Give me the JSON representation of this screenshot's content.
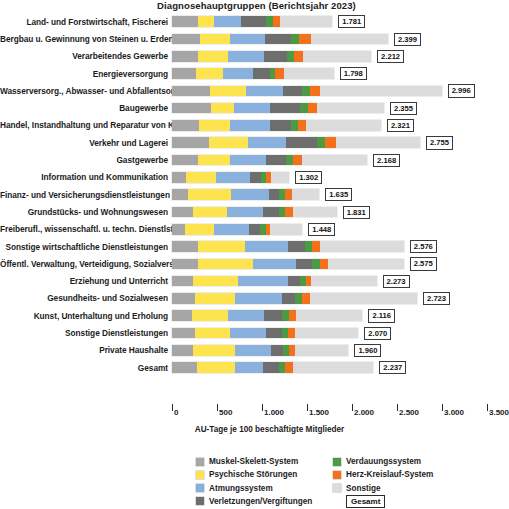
{
  "chart_data": {
    "type": "bar",
    "subtype": "horizontal-stacked",
    "title": "Diagnosehauptgruppen (Berichtsjahr 2023)",
    "xlabel": "AU-Tage je 100 beschäftigte Mitglieder",
    "ylabel": "",
    "xlim": [
      0,
      3500
    ],
    "xticks": [
      0,
      500,
      1000,
      1500,
      2000,
      2500,
      3000,
      3500
    ],
    "xtick_labels": [
      "0",
      "500",
      "1.000",
      "1.500",
      "2.000",
      "2.500",
      "3.000",
      "3.500"
    ],
    "grid": false,
    "legend_position": "bottom",
    "series": [
      {
        "name": "Muskel-Skelett-System",
        "color": "#a6a6a6",
        "values": [
          290,
          310,
          290,
          270,
          420,
          430,
          300,
          410,
          290,
          160,
          180,
          230,
          140,
          290,
          290,
          230,
          260,
          230,
          250,
          230,
          280
        ]
      },
      {
        "name": "Psychische Störungen",
        "color": "#fde44f",
        "values": [
          180,
          340,
          330,
          300,
          400,
          260,
          340,
          430,
          350,
          330,
          480,
          380,
          330,
          520,
          610,
          500,
          440,
          420,
          390,
          470,
          420
        ]
      },
      {
        "name": "Atmungssystem",
        "color": "#8ab0de",
        "values": [
          300,
          380,
          400,
          330,
          410,
          400,
          450,
          430,
          400,
          380,
          420,
          400,
          390,
          480,
          480,
          560,
          520,
          420,
          410,
          400,
          310
        ]
      },
      {
        "name": "Verletzungen/Vergiftungen",
        "color": "#6e6e6e",
        "values": [
          280,
          290,
          260,
          190,
          220,
          330,
          230,
          340,
          230,
          120,
          110,
          180,
          120,
          190,
          180,
          130,
          150,
          210,
          170,
          130,
          180
        ]
      },
      {
        "name": "Verdauungssystem",
        "color": "#4c9a43",
        "values": [
          70,
          90,
          80,
          60,
          80,
          90,
          80,
          90,
          80,
          60,
          70,
          70,
          60,
          80,
          80,
          70,
          80,
          80,
          70,
          70,
          70
        ]
      },
      {
        "name": "Herz-Kreislauf-System",
        "color": "#f4701b",
        "values": [
          80,
          130,
          100,
          90,
          110,
          100,
          90,
          120,
          90,
          50,
          70,
          80,
          50,
          90,
          90,
          60,
          80,
          90,
          80,
          70,
          80
        ]
      },
      {
        "name": "Sonstige",
        "color": "#dcdcdc",
        "values": [
          581,
          859,
          752,
          558,
          1356,
          742,
          831,
          935,
          728,
          202,
          305,
          491,
          358,
          926,
          845,
          723,
          1193,
          767,
          700,
          590,
          897
        ]
      }
    ],
    "categories": [
      "Land- und Forstwirtschaft, Fischerei",
      "Bergbau u. Gewinnung von Steinen u. Erden",
      "Verarbeitendes Gewerbe",
      "Energieversorgung",
      "Wasserversorg., Abwasser- und Abfallentsorg.",
      "Baugewerbe",
      "Handel, Instandhaltung und Reparatur von Kfz",
      "Verkehr und Lagerei",
      "Gastgewerbe",
      "Information und Kommunikation",
      "Finanz- und Versicherungsdienstleistungen",
      "Grundstücks- und Wohnungswesen",
      "Freiberufl., wissenschaftl. u. techn. Dienstlstg.",
      "Sonstige wirtschaftliche Dienstleistungen",
      "Öffentl. Verwaltung, Verteidigung, Sozialvers.",
      "Erziehung und Unterricht",
      "Gesundheits- und Sozialwesen",
      "Kunst, Unterhaltung und Erholung",
      "Sonstige Dienstleistungen",
      "Private Haushalte",
      "Gesamt"
    ],
    "totals": [
      1781,
      2399,
      2212,
      1798,
      2996,
      2355,
      2321,
      2755,
      2168,
      1302,
      1635,
      1831,
      1448,
      2576,
      2575,
      2273,
      2723,
      2116,
      2070,
      1960,
      2237
    ],
    "total_labels": [
      "1.781",
      "2.399",
      "2.212",
      "1.798",
      "2.996",
      "2.355",
      "2.321",
      "2.755",
      "2.168",
      "1.302",
      "1.635",
      "1.831",
      "1.448",
      "2.576",
      "2.575",
      "2.273",
      "2.723",
      "2.116",
      "2.070",
      "1.960",
      "2.237"
    ]
  },
  "legend": {
    "column1": [
      {
        "label": "Muskel-Skelett-System",
        "color": "#a6a6a6",
        "icon": "color-swatch-icon"
      },
      {
        "label": "Psychische Störungen",
        "color": "#fde44f",
        "icon": "color-swatch-icon"
      },
      {
        "label": "Atmungssystem",
        "color": "#8ab0de",
        "icon": "color-swatch-icon"
      },
      {
        "label": "Verletzungen/Vergiftungen",
        "color": "#6e6e6e",
        "icon": "color-swatch-icon"
      }
    ],
    "column2": [
      {
        "label": "Verdauungssystem",
        "color": "#4c9a43",
        "icon": "color-swatch-icon"
      },
      {
        "label": "Herz-Kreislauf-System",
        "color": "#f4701b",
        "icon": "color-swatch-icon"
      },
      {
        "label": "Sonstige",
        "color": "#dcdcdc",
        "icon": "color-swatch-icon"
      }
    ],
    "total_key": "Gesamt"
  }
}
